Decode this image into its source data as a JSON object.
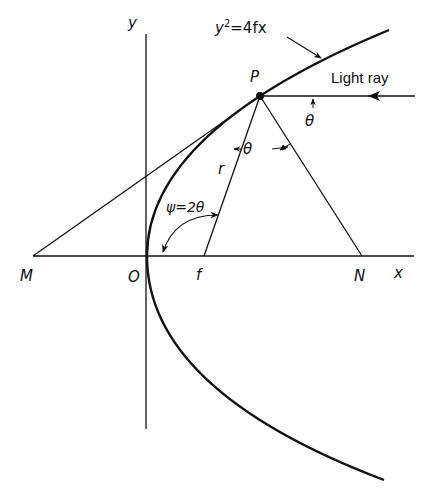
{
  "diagram": {
    "type": "parabolic reflector geometry",
    "equation_label": "y²=4fx",
    "equation_base": "y",
    "equation_exp": "2",
    "equation_rest": "=4fx",
    "light_ray_label": "Light ray",
    "point_labels": {
      "P": "P",
      "M": "M",
      "O": "O",
      "f": "f",
      "N": "N"
    },
    "axis_labels": {
      "x": "x",
      "y": "y"
    },
    "segment_labels": {
      "r": "r"
    },
    "angle_labels": {
      "theta_incident": "θ",
      "theta_reflected": "θ",
      "psi": "ψ=2θ"
    },
    "colors": {
      "ink": "#111111",
      "background": "#ffffff"
    }
  }
}
